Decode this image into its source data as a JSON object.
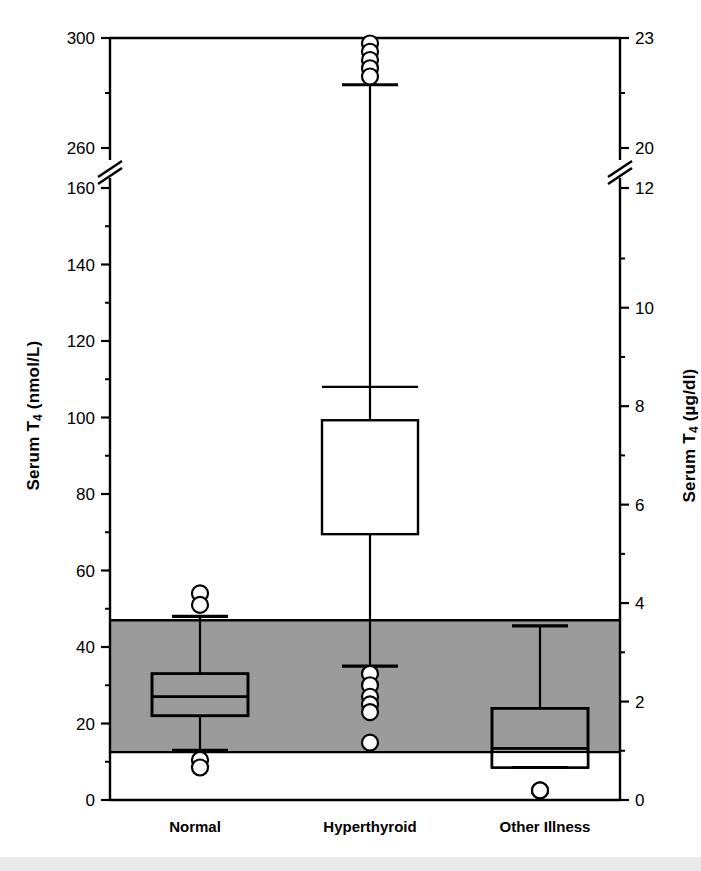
{
  "chart_data": {
    "type": "box",
    "title": "",
    "categories": [
      "Normal",
      "Hyperthyroid",
      "Other Illness"
    ],
    "left_axis": {
      "label": "Serum T4 (nmol/L)",
      "label_main": "Serum T",
      "label_sub": "4",
      "label_units": " (nmol/L)",
      "ticks_labeled": [
        0,
        20,
        40,
        60,
        80,
        100,
        120,
        140,
        160,
        260,
        300
      ],
      "ticks_minor": [
        10,
        30,
        50,
        70,
        90,
        110,
        130,
        150,
        280
      ],
      "axis_break_between": [
        160,
        260
      ],
      "range_lower_segment": [
        0,
        160
      ],
      "range_upper_segment": [
        260,
        300
      ]
    },
    "right_axis": {
      "label": "Serum T4 (µg/dl)",
      "label_main": "Serum T",
      "label_sub": "4",
      "label_units": " (µg/dl)",
      "ticks_labeled": [
        0,
        2,
        4,
        6,
        8,
        10,
        12,
        20,
        23
      ],
      "ticks_minor": [
        1,
        3,
        5,
        7,
        9,
        11,
        21.5
      ],
      "axis_break_between": [
        12,
        20
      ],
      "conversion_note": "nmol/L ÷ 12.87 = µg/dl"
    },
    "reference_band": {
      "name": "reference-range-band",
      "lower_nmol": 12.5,
      "upper_nmol": 47,
      "lower_ugdl": 1.0,
      "upper_ugdl": 3.65,
      "color": "#999999"
    },
    "series": [
      {
        "name": "Normal",
        "whisker_low": 13,
        "q1": 22,
        "median": 27,
        "q3": 33,
        "whisker_high": 48,
        "outliers_high": [
          54,
          51
        ],
        "outliers_low": [
          10.5,
          8.5
        ]
      },
      {
        "name": "Hyperthyroid",
        "whisker_low": 35,
        "q1": 69.5,
        "median": 108,
        "q3": 161,
        "whisker_high": 283,
        "outliers_high": [
          298,
          295,
          292,
          289,
          286
        ],
        "outliers_low": [
          33,
          30,
          27,
          25,
          23,
          15
        ]
      },
      {
        "name": "Other Illness",
        "whisker_low": 8.5,
        "q1": 8.5,
        "median": 13.5,
        "q3": 24,
        "whisker_high": 45.5,
        "outliers_high": [],
        "outliers_low": [
          2.5
        ]
      }
    ],
    "grid": false,
    "legend": "none"
  },
  "colors": {
    "axis": "#000000",
    "band_fill": "#9b9b9b",
    "box_stroke": "#000000",
    "box_fill": "#ffffff",
    "outlier_fill": "#ffffff",
    "page_background": "#ffffff",
    "footer": "#e9e9e9"
  }
}
